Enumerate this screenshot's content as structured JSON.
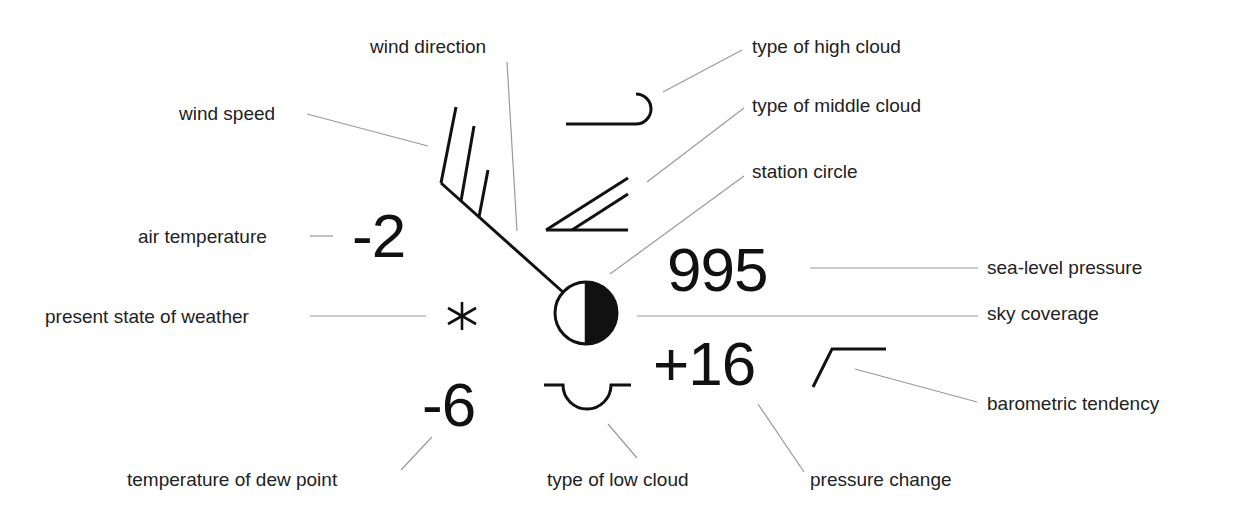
{
  "diagram": {
    "values": {
      "air_temperature": "-2",
      "sea_level_pressure": "995",
      "pressure_change": "+16",
      "dew_point": "-6",
      "present_weather_symbol": "✱"
    },
    "labels": {
      "wind_direction": "wind direction",
      "type_of_high_cloud": "type of high cloud",
      "wind_speed": "wind speed",
      "type_of_middle_cloud": "type of middle cloud",
      "station_circle": "station circle",
      "air_temperature": "air temperature",
      "sea_level_pressure": "sea-level pressure",
      "present_state_of_weather": "present state of weather",
      "sky_coverage": "sky coverage",
      "barometric_tendency": "barometric tendency",
      "temperature_of_dew_point": "temperature of dew point",
      "type_of_low_cloud": "type of low cloud",
      "pressure_change": "pressure change"
    },
    "symbols": {
      "wind_barb": "wind-barb-icon (three full barbs)",
      "high_cloud": "cirrus-hook-icon",
      "middle_cloud": "altostratus-wedge-icon",
      "low_cloud": "cumulus-dome-icon",
      "sky_coverage": "half-filled-circle-icon",
      "present_weather": "snow-asterisk-icon",
      "barometric_tendency": "rising-then-steady-icon"
    },
    "colors": {
      "symbol": "#111111",
      "leader_line": "#9a9a9a",
      "text": "#222222",
      "background": "#ffffff"
    }
  }
}
